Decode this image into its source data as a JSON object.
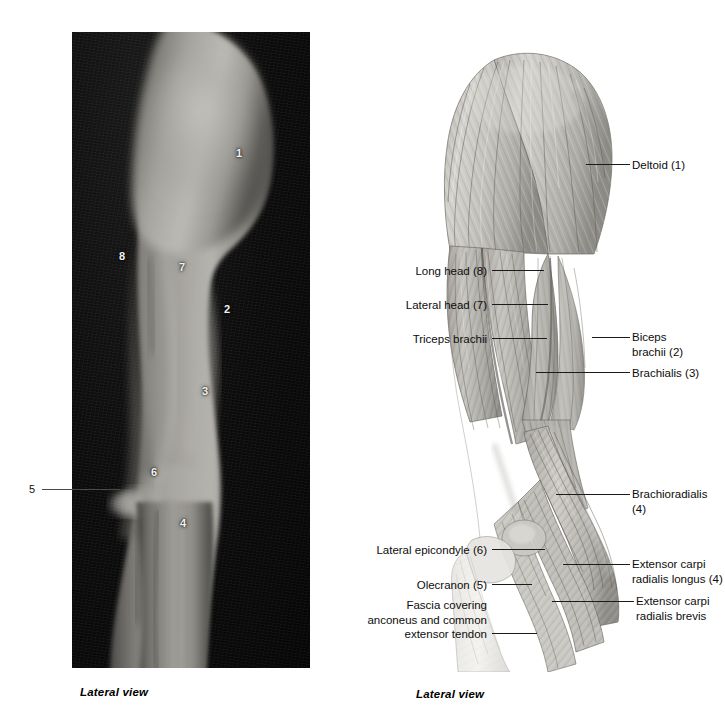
{
  "figure": {
    "left_panel": {
      "type": "photograph",
      "caption": "Lateral view",
      "numeric_callouts": [
        {
          "id": "1",
          "x": 236,
          "y": 150,
          "refers_to": "Deltoid"
        },
        {
          "id": "8",
          "x": 119,
          "y": 253,
          "refers_to": "Long head of triceps brachii"
        },
        {
          "id": "7",
          "x": 179,
          "y": 264,
          "refers_to": "Lateral head of triceps brachii"
        },
        {
          "id": "2",
          "x": 224,
          "y": 306,
          "refers_to": "Biceps brachii"
        },
        {
          "id": "3",
          "x": 202,
          "y": 388,
          "refers_to": "Brachialis"
        },
        {
          "id": "6",
          "x": 151,
          "y": 469,
          "refers_to": "Lateral epicondyle"
        },
        {
          "id": "4",
          "x": 180,
          "y": 520,
          "refers_to": "Brachioradialis"
        }
      ],
      "external_callout": {
        "id": "5",
        "label": "5",
        "refers_to": "Olecranon",
        "x": 30,
        "y": 484
      }
    },
    "right_panel": {
      "type": "anatomical-illustration",
      "caption": "Lateral view",
      "labels": [
        {
          "key": "deltoid",
          "text": "Deltoid (1)",
          "side": "right",
          "x": 632,
          "y": 158,
          "lines": 1
        },
        {
          "key": "long-head",
          "text": "Long head (8)",
          "side": "left",
          "x": 389,
          "y": 264,
          "lines": 1
        },
        {
          "key": "lateral-head",
          "text": "Lateral head (7)",
          "side": "left",
          "x": 389,
          "y": 298,
          "lines": 1
        },
        {
          "key": "triceps",
          "text": "Triceps brachii",
          "side": "left",
          "x": 389,
          "y": 332,
          "lines": 1
        },
        {
          "key": "biceps",
          "text": "Biceps\nbrachii (2)",
          "side": "right",
          "x": 632,
          "y": 330,
          "lines": 2
        },
        {
          "key": "brachialis",
          "text": "Brachialis (3)",
          "side": "right",
          "x": 632,
          "y": 366,
          "lines": 1
        },
        {
          "key": "brachioradialis",
          "text": "Brachioradialis\n(4)",
          "side": "right",
          "x": 632,
          "y": 487,
          "lines": 2
        },
        {
          "key": "lat-epicondyle",
          "text": "Lateral epicondyle (6)",
          "side": "left",
          "x": 370,
          "y": 543,
          "lines": 1
        },
        {
          "key": "ecrl",
          "text": "Extensor carpi\nradialis longus (4)",
          "side": "right",
          "x": 632,
          "y": 557,
          "lines": 2
        },
        {
          "key": "olecranon",
          "text": "Olecranon (5)",
          "side": "left",
          "x": 396,
          "y": 578,
          "lines": 1
        },
        {
          "key": "ecrb",
          "text": "Extensor carpi\nradialis brevis",
          "side": "right",
          "x": 636,
          "y": 594,
          "lines": 2
        },
        {
          "key": "fascia",
          "text": "Fascia covering\nanconeus and common\nextensor tendon",
          "side": "left",
          "x": 330,
          "y": 598,
          "lines": 3
        }
      ]
    }
  },
  "colors": {
    "page_background": "#ffffff",
    "photo_background": "#0a0a0a",
    "skin_highlight": "#b9b7b2",
    "skin_midtone": "#8d8b86",
    "skin_shadow": "#3a3936",
    "leader_line": "#1b1b1b",
    "muscle_light": "#d8d6d1",
    "muscle_mid": "#a9a6a0",
    "muscle_dark": "#6f6c66",
    "tendon_pale": "#efeeea",
    "label_text": "#0d0d0d",
    "photo_number_text": "#f2f2f2"
  }
}
